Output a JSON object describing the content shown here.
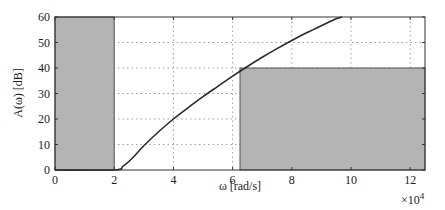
{
  "chart_data": {
    "type": "line",
    "title": "",
    "xlabel": "ω [rad/s]",
    "ylabel": "A(ω) [dB]",
    "x_multiplier": "×10⁴",
    "x_multiplier_base": "×10",
    "x_multiplier_exp": "4",
    "xlim": [
      0,
      12.5
    ],
    "ylim": [
      0,
      60
    ],
    "grid": true,
    "x_ticks": [
      "0",
      "2",
      "4",
      "6",
      "8",
      "10",
      "12"
    ],
    "y_ticks": [
      "0",
      "10",
      "20",
      "30",
      "40",
      "50",
      "60"
    ],
    "series": [
      {
        "name": "A(ω)",
        "x": [
          0,
          2.0,
          2.3,
          2.6,
          3.0,
          3.5,
          4.0,
          4.5,
          5.0,
          5.5,
          6.0,
          6.5,
          7.0,
          7.5,
          8.0,
          8.5,
          9.0,
          9.5,
          9.7
        ],
        "y": [
          0,
          0,
          1.5,
          4.5,
          9.5,
          15,
          20,
          24.5,
          28.8,
          32.8,
          36.8,
          40.6,
          44.2,
          47.6,
          50.8,
          53.8,
          56.6,
          59.3,
          60
        ]
      }
    ],
    "shaded_regions": [
      {
        "name": "passband-constraint",
        "x_range": [
          0,
          2
        ],
        "y_range": [
          0,
          60
        ],
        "color": "#b4b4b4"
      },
      {
        "name": "stopband-constraint",
        "x_range": [
          6.25,
          12.5
        ],
        "y_range": [
          0,
          40
        ],
        "color": "#b4b4b4"
      }
    ],
    "colors": {
      "curve": "#2a2a2a",
      "fill": "#b4b4b4",
      "grid": "#888888",
      "axes": "#333333"
    }
  }
}
